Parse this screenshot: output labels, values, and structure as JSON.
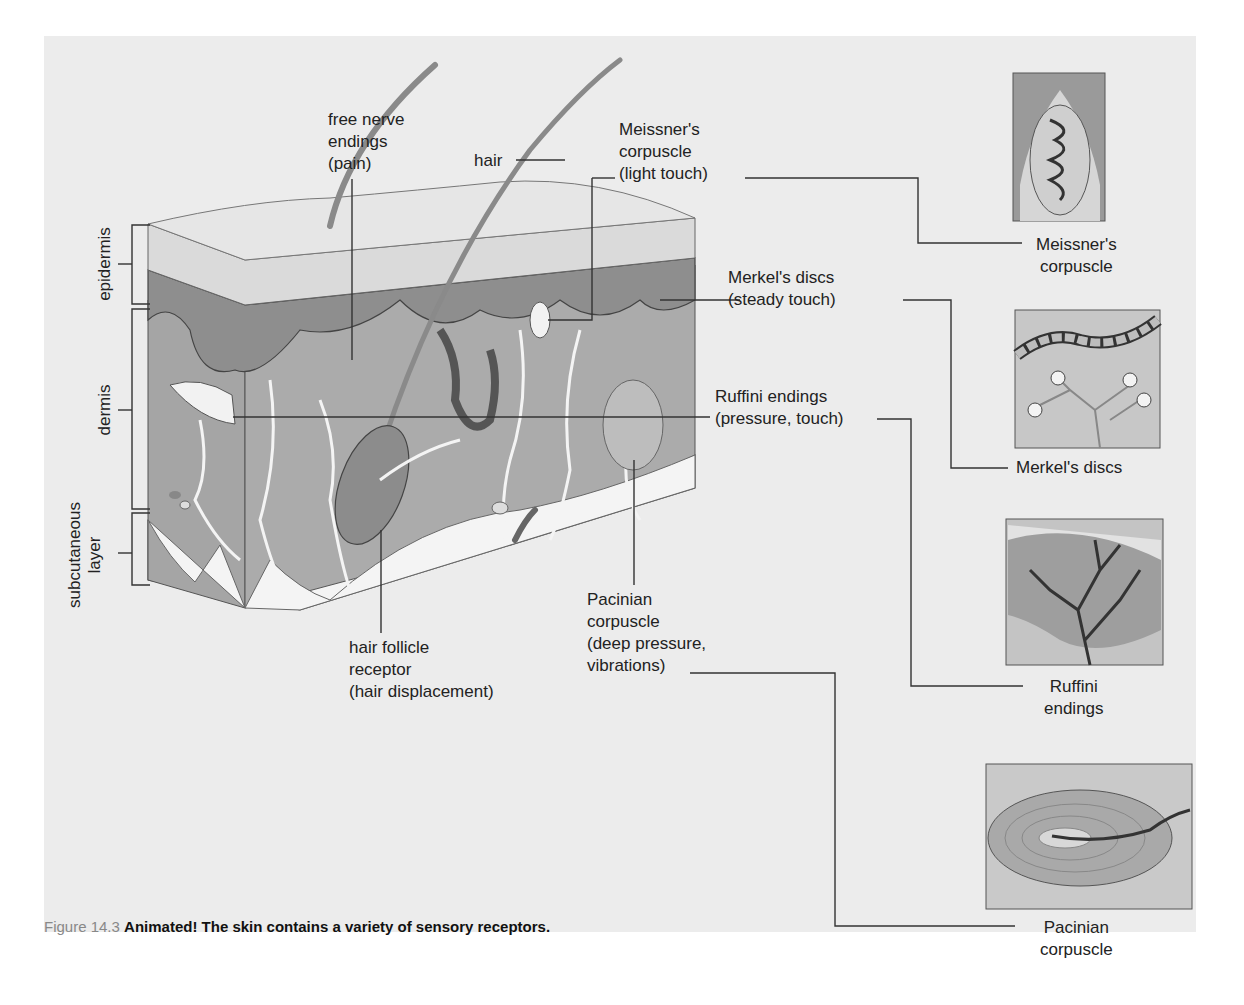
{
  "figure": {
    "caption": {
      "number": "Figure 14.3",
      "title": "Animated!",
      "text": "The skin contains a variety of sensory receptors."
    },
    "layers": {
      "epidermis": "epidermis",
      "dermis": "dermis",
      "subcutaneous": "subcutaneous\nlayer"
    },
    "receptor_labels": {
      "free_nerve_endings": "free nerve\nendings\n(pain)",
      "hair": "hair",
      "meissner": "Meissner's\ncorpuscle\n(light touch)",
      "merkel": "Merkel's discs\n(steady touch)",
      "ruffini": "Ruffini endings\n(pressure, touch)",
      "hair_follicle": "hair follicle\nreceptor\n(hair displacement)",
      "pacinian": "Pacinian\ncorpuscle\n(deep pressure,\nvibrations)"
    },
    "insets": [
      {
        "id": "meissner",
        "label": "Meissner's\ncorpuscle"
      },
      {
        "id": "merkel",
        "label": "Merkel's discs"
      },
      {
        "id": "ruffini",
        "label": "Ruffini\nendings"
      },
      {
        "id": "pacinian",
        "label": "Pacinian\ncorpuscle"
      }
    ],
    "colors": {
      "panel": "#ececec",
      "dermis": "#a8a8a8",
      "epidermis_top": "#dcdcdc",
      "epidermis_cells": "#8f8f8f",
      "subcutaneous": "#f6f6f6",
      "line": "#333333"
    }
  }
}
